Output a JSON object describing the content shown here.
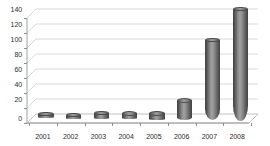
{
  "chart_data": {
    "type": "bar",
    "title": "",
    "subtitle": "",
    "xlabel": "",
    "ylabel": "",
    "categories": [
      "2001",
      "2002",
      "2003",
      "2004",
      "2005",
      "2006",
      "2007",
      "2008"
    ],
    "values": [
      3,
      2,
      5,
      5,
      5,
      22,
      100,
      140
    ],
    "series": [
      {
        "name": "",
        "values": [
          3,
          2,
          5,
          5,
          5,
          22,
          100,
          140
        ]
      }
    ],
    "ylim": [
      0,
      150
    ],
    "ytick_labels": [
      "0",
      "20",
      "40",
      "60",
      "80",
      "100",
      "120",
      "140"
    ],
    "ytick_values": [
      0,
      20,
      40,
      60,
      80,
      100,
      120,
      140
    ],
    "grid": true,
    "legend": "none",
    "style": "3d-cylinder",
    "bar_color": "#8a8a8a",
    "bar_edge_color": "#3f3f3f",
    "grid_color": "#c9c9c9",
    "axis_color": "#8c8c8c",
    "text_color": "#2b2b2b",
    "background_color": "#ffffff"
  }
}
